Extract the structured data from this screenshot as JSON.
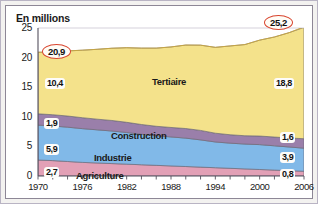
{
  "chart_data": {
    "type": "area",
    "title": "En millions",
    "xlabel": "",
    "ylabel": "En millions",
    "xlim": [
      1970,
      2006
    ],
    "ylim": [
      0,
      25
    ],
    "yticks": [
      0,
      5,
      10,
      15,
      20,
      25
    ],
    "xticks": [
      1970,
      1976,
      1982,
      1988,
      1994,
      2000,
      2006
    ],
    "grid": true,
    "stacked": true,
    "legend_position": "inline-annotations",
    "x": [
      1970,
      1972,
      1974,
      1976,
      1978,
      1980,
      1982,
      1984,
      1986,
      1988,
      1990,
      1992,
      1994,
      1996,
      1998,
      2000,
      2002,
      2004,
      2006
    ],
    "series": [
      {
        "name": "Agriculture",
        "color": "#e2a0b6",
        "values": [
          2.7,
          2.6,
          2.45,
          2.3,
          2.2,
          2.1,
          2.0,
          1.9,
          1.8,
          1.7,
          1.6,
          1.5,
          1.4,
          1.3,
          1.2,
          1.1,
          1.0,
          0.9,
          0.8
        ],
        "start_value": "2,7",
        "end_value": "0,8"
      },
      {
        "name": "Industrie",
        "color": "#81b9e8",
        "values": [
          5.9,
          5.85,
          5.8,
          5.7,
          5.6,
          5.5,
          5.35,
          5.15,
          5.0,
          4.9,
          4.8,
          4.6,
          4.35,
          4.25,
          4.2,
          4.2,
          4.1,
          4.0,
          3.9
        ],
        "start_value": "5,9",
        "end_value": "3,9"
      },
      {
        "name": "Construction",
        "color": "#9a7faa",
        "values": [
          1.9,
          1.9,
          1.88,
          1.85,
          1.8,
          1.78,
          1.72,
          1.65,
          1.6,
          1.6,
          1.62,
          1.6,
          1.48,
          1.42,
          1.4,
          1.45,
          1.48,
          1.52,
          1.6
        ],
        "start_value": "1,9",
        "end_value": "1,6"
      },
      {
        "name": "Tertiaire",
        "color": "#f4e28b",
        "values": [
          10.4,
          10.6,
          11.0,
          11.4,
          11.8,
          12.2,
          12.6,
          12.9,
          13.2,
          13.6,
          14.1,
          14.4,
          14.5,
          15.0,
          15.4,
          16.2,
          16.9,
          17.8,
          18.8
        ],
        "start_value": "10,4",
        "end_value": "18,8"
      }
    ],
    "totals": [
      20.9,
      20.95,
      21.13,
      21.25,
      21.4,
      21.58,
      21.67,
      21.6,
      21.6,
      21.8,
      22.12,
      22.1,
      21.73,
      21.97,
      22.2,
      22.95,
      23.48,
      24.22,
      25.2
    ],
    "annotations": [
      {
        "name": "total-start",
        "label": "20,9"
      },
      {
        "name": "total-end",
        "label": "25,2"
      }
    ]
  }
}
